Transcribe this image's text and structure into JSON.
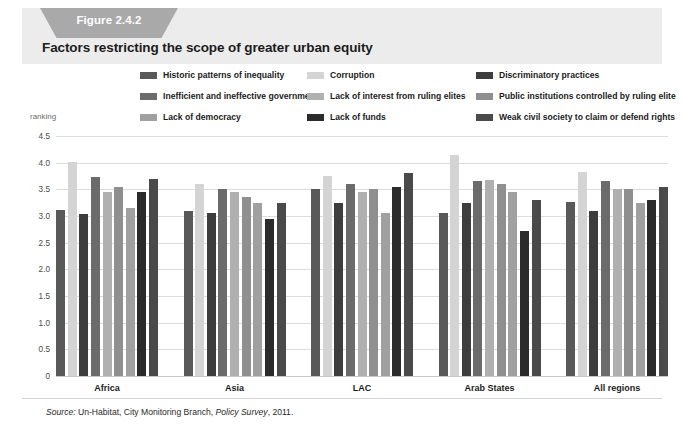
{
  "figure": {
    "tab_label": "Figure 2.4.2",
    "title": "Factors restricting the scope of greater urban equity",
    "axis_note": "ranking",
    "source_prefix": "Source:",
    "source_text": " Un-Habitat, City Monitoring Branch, ",
    "source_italic": "Policy Survey",
    "source_suffix": ", 2011."
  },
  "chart_data": {
    "type": "bar",
    "title": "Factors restricting the scope of greater urban equity",
    "xlabel": "",
    "ylabel": "ranking",
    "ylim": [
      0,
      4.5
    ],
    "ytick_labels": [
      "0",
      "0.5",
      "1.0",
      "1.5",
      "2.0",
      "2.5",
      "3.0",
      "3.5",
      "4.0",
      "4.5"
    ],
    "ytick_values": [
      0,
      0.5,
      1.0,
      1.5,
      2.0,
      2.5,
      3.0,
      3.5,
      4.0,
      4.5
    ],
    "grid": true,
    "legend_position": "top",
    "categories": [
      "Africa",
      "Asia",
      "LAC",
      "Arab States",
      "All regions"
    ],
    "series": [
      {
        "name": "Historic patterns of inequality",
        "color": "#595959",
        "values": [
          3.12,
          3.1,
          3.5,
          3.05,
          3.27
        ]
      },
      {
        "name": "Corruption",
        "color": "#d4d4d4",
        "values": [
          4.02,
          3.6,
          3.75,
          4.15,
          3.83
        ]
      },
      {
        "name": "Discriminatory practices",
        "color": "#3d3d3d",
        "values": [
          3.03,
          3.05,
          3.25,
          3.25,
          3.1
        ]
      },
      {
        "name": "Inefficient and ineffective government",
        "color": "#6b6b6b",
        "values": [
          3.73,
          3.5,
          3.6,
          3.65,
          3.65
        ]
      },
      {
        "name": "Lack of interest from ruling elites",
        "color": "#b0b0b0",
        "values": [
          3.45,
          3.45,
          3.45,
          3.67,
          3.5
        ]
      },
      {
        "name": "Public institutions controlled by ruling elite",
        "color": "#8f8f8f",
        "values": [
          3.55,
          3.35,
          3.5,
          3.6,
          3.5
        ]
      },
      {
        "name": "Lack of democracy",
        "color": "#a0a0a0",
        "values": [
          3.15,
          3.25,
          3.05,
          3.45,
          3.25
        ]
      },
      {
        "name": "Lack of funds",
        "color": "#2b2b2b",
        "values": [
          3.45,
          2.95,
          3.55,
          2.72,
          3.3
        ]
      },
      {
        "name": "Weak civil society to claim or defend rights",
        "color": "#4a4a4a",
        "values": [
          3.7,
          3.25,
          3.8,
          3.3,
          3.55
        ]
      }
    ]
  },
  "legend": [
    {
      "label": "Historic patterns of inequality",
      "color": "#595959",
      "col": 0,
      "row": 0
    },
    {
      "label": "Inefficient and ineffective government",
      "color": "#6b6b6b",
      "col": 0,
      "row": 1
    },
    {
      "label": "Lack of democracy",
      "color": "#a0a0a0",
      "col": 0,
      "row": 2
    },
    {
      "label": "Corruption",
      "color": "#d4d4d4",
      "col": 1,
      "row": 0
    },
    {
      "label": "Lack of interest from ruling elites",
      "color": "#b0b0b0",
      "col": 1,
      "row": 1
    },
    {
      "label": "Lack of funds",
      "color": "#2b2b2b",
      "col": 1,
      "row": 2
    },
    {
      "label": "Discriminatory practices",
      "color": "#3d3d3d",
      "col": 2,
      "row": 0
    },
    {
      "label": "Public institutions controlled by ruling elite",
      "color": "#8f8f8f",
      "col": 2,
      "row": 1
    },
    {
      "label": "Weak civil society to claim or defend rights",
      "color": "#4a4a4a",
      "col": 2,
      "row": 2
    }
  ]
}
